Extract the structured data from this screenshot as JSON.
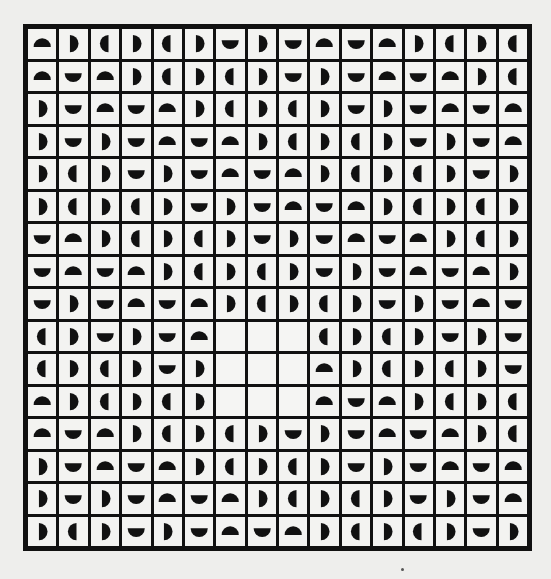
{
  "artwork": {
    "rows": 16,
    "cols": 16,
    "colors": {
      "background": "#eeeeec",
      "grid_line": "#111111",
      "tile": "#f3f3f1",
      "shape": "#111111"
    },
    "legend": {
      "up": "semicircle-dome-up",
      "down": "semicircle-dome-down",
      "right": "semicircle-dome-right",
      "left": "semicircle-dome-left",
      "empty": "blank-tile"
    },
    "grid": [
      [
        "up",
        "right",
        "left",
        "right",
        "left",
        "right",
        "down",
        "right",
        "down",
        "up",
        "down",
        "up",
        "right",
        "left",
        "right",
        "left"
      ],
      [
        "up",
        "down",
        "up",
        "right",
        "left",
        "right",
        "left",
        "right",
        "down",
        "right",
        "down",
        "up",
        "down",
        "up",
        "right",
        "left"
      ],
      [
        "right",
        "down",
        "up",
        "down",
        "up",
        "right",
        "left",
        "right",
        "left",
        "right",
        "down",
        "right",
        "down",
        "up",
        "down",
        "up"
      ],
      [
        "right",
        "down",
        "right",
        "down",
        "up",
        "down",
        "up",
        "right",
        "left",
        "right",
        "left",
        "right",
        "down",
        "right",
        "down",
        "up"
      ],
      [
        "right",
        "left",
        "right",
        "down",
        "right",
        "down",
        "up",
        "down",
        "up",
        "right",
        "left",
        "right",
        "left",
        "right",
        "down",
        "right"
      ],
      [
        "right",
        "left",
        "right",
        "left",
        "right",
        "down",
        "right",
        "down",
        "up",
        "down",
        "up",
        "right",
        "left",
        "right",
        "left",
        "right"
      ],
      [
        "down",
        "up",
        "right",
        "left",
        "right",
        "left",
        "right",
        "down",
        "right",
        "down",
        "up",
        "down",
        "up",
        "right",
        "left",
        "right"
      ],
      [
        "down",
        "up",
        "down",
        "up",
        "right",
        "left",
        "right",
        "left",
        "right",
        "down",
        "right",
        "down",
        "up",
        "down",
        "up",
        "right"
      ],
      [
        "down",
        "right",
        "down",
        "up",
        "down",
        "up",
        "right",
        "left",
        "right",
        "left",
        "right",
        "down",
        "right",
        "down",
        "up",
        "down"
      ],
      [
        "left",
        "right",
        "down",
        "right",
        "down",
        "up",
        "empty",
        "empty",
        "empty",
        "left",
        "right",
        "left",
        "right",
        "down",
        "right",
        "down"
      ],
      [
        "left",
        "right",
        "left",
        "right",
        "down",
        "right",
        "empty",
        "empty",
        "empty",
        "up",
        "right",
        "left",
        "right",
        "left",
        "right",
        "down"
      ],
      [
        "up",
        "right",
        "left",
        "right",
        "left",
        "right",
        "empty",
        "empty",
        "empty",
        "up",
        "down",
        "up",
        "right",
        "left",
        "right",
        "left"
      ],
      [
        "up",
        "down",
        "up",
        "right",
        "left",
        "right",
        "left",
        "right",
        "down",
        "right",
        "down",
        "up",
        "down",
        "up",
        "right",
        "left"
      ],
      [
        "right",
        "down",
        "up",
        "down",
        "up",
        "right",
        "left",
        "right",
        "left",
        "right",
        "down",
        "right",
        "down",
        "up",
        "down",
        "up"
      ],
      [
        "right",
        "down",
        "right",
        "down",
        "up",
        "down",
        "up",
        "right",
        "left",
        "right",
        "left",
        "right",
        "down",
        "right",
        "down",
        "up"
      ],
      [
        "right",
        "left",
        "right",
        "down",
        "right",
        "down",
        "up",
        "down",
        "up",
        "right",
        "left",
        "right",
        "left",
        "right",
        "down",
        "right"
      ]
    ]
  }
}
